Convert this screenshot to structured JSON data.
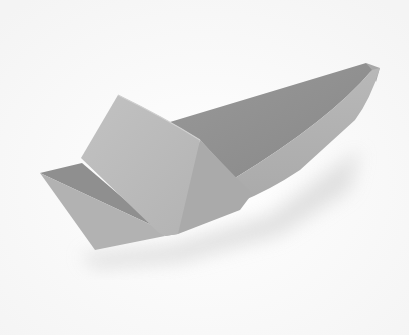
{
  "image": {
    "subject": "Origami paper boat",
    "description": "Grey paper boat with a folded sail panel, photographed on a white background with soft shadow",
    "colors": {
      "background": "#fbfbfb",
      "shadow": "#e6e6e6",
      "hull_inner_dark": "#8e8e8e",
      "hull_inner_mid": "#9c9c9c",
      "hull_outer_light": "#b4b4b4",
      "sail_front": "#bcbcbc",
      "sail_side": "#a9a9a9",
      "hull_left_outer": "#b1b1b1"
    }
  }
}
